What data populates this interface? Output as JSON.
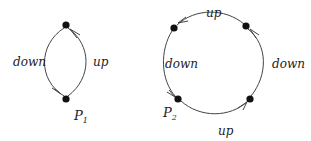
{
  "diagrams": [
    {
      "id": "left-graph",
      "nodes": [
        {
          "id": "top",
          "label": ""
        },
        {
          "id": "P1",
          "label": "P",
          "subscript": "1"
        }
      ],
      "edges": [
        {
          "from": "top",
          "to": "P1",
          "label": "down"
        },
        {
          "from": "P1",
          "to": "top",
          "label": "up"
        }
      ]
    },
    {
      "id": "right-graph",
      "nodes": [
        {
          "id": "top-left",
          "label": ""
        },
        {
          "id": "top-right",
          "label": ""
        },
        {
          "id": "bottom-right",
          "label": ""
        },
        {
          "id": "P2",
          "label": "P",
          "subscript": "2"
        }
      ],
      "edges": [
        {
          "from": "top-left",
          "to": "P2",
          "label": "down"
        },
        {
          "from": "P2",
          "to": "bottom-right",
          "label": "up"
        },
        {
          "from": "bottom-right",
          "to": "top-right",
          "label": "down"
        },
        {
          "from": "top-right",
          "to": "top-left",
          "label": "up"
        }
      ]
    }
  ]
}
